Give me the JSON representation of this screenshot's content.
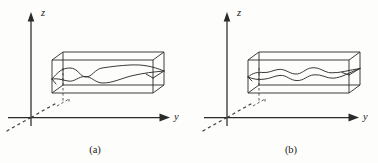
{
  "figure": {
    "background_color": "#fdfdfc",
    "line_color": "#2e2e2e",
    "panels": [
      {
        "id": "a",
        "caption": "(a)",
        "axes": {
          "vertical_label": "z",
          "horizontal_label": "y",
          "depth_label": ""
        },
        "description": "3D rectangular waveguide box on y-z axes containing two wavy mode curves",
        "wave": {
          "cycles": 2.0,
          "amplitude": 5.5,
          "style": "low-frequency large-amplitude"
        }
      },
      {
        "id": "b",
        "caption": "(b)",
        "axes": {
          "vertical_label": "z",
          "horizontal_label": "y",
          "depth_label": ""
        },
        "description": "3D rectangular waveguide box on y-z axes containing two wavy mode curves",
        "wave": {
          "cycles": 3.5,
          "amplitude": 3.6,
          "style": "high-frequency small-amplitude"
        }
      }
    ]
  }
}
